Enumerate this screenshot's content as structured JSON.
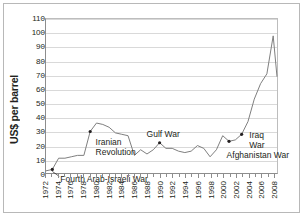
{
  "chart_data": {
    "type": "line",
    "title": "",
    "xlabel": "",
    "ylabel": "US$ per barrel",
    "ylim": [
      0,
      110
    ],
    "xlim": [
      1972,
      2008.6
    ],
    "ytick_labels": [
      "0",
      "10",
      "20",
      "30",
      "40",
      "50",
      "60",
      "70",
      "80",
      "90",
      "100",
      "110"
    ],
    "ytick_values": [
      0,
      10,
      20,
      30,
      40,
      50,
      60,
      70,
      80,
      90,
      100,
      110
    ],
    "xtick_labels": [
      "1972",
      "1974",
      "1976",
      "1978",
      "1980",
      "1982",
      "1984",
      "1986",
      "1988",
      "1990",
      "1992",
      "1994",
      "1996",
      "1998",
      "2000",
      "2002",
      "2004",
      "2006",
      "2008"
    ],
    "xtick_values": [
      1972,
      1974,
      1976,
      1978,
      1980,
      1982,
      1984,
      1986,
      1988,
      1990,
      1992,
      1994,
      1996,
      1998,
      2000,
      2002,
      2004,
      2006,
      2008
    ],
    "grid": true,
    "legend": "none",
    "series": [
      {
        "name": "Crude oil price",
        "color": "#7f7f7f",
        "x": [
          1972,
          1973,
          1974,
          1975,
          1976,
          1977,
          1978,
          1979,
          1980,
          1981,
          1982,
          1983,
          1984,
          1985,
          1986,
          1987,
          1988,
          1989,
          1990,
          1991,
          1992,
          1993,
          1994,
          1995,
          1996,
          1997,
          1998,
          1999,
          2000,
          2001,
          2002,
          2003,
          2004,
          2005,
          2006,
          2007,
          2008,
          2008.6
        ],
        "values": [
          2,
          3,
          11,
          11,
          12,
          13,
          13,
          30,
          36,
          35,
          33,
          29,
          28,
          27,
          13,
          17,
          14,
          17,
          22,
          18,
          18,
          16,
          15,
          16,
          20,
          18,
          12,
          17,
          27,
          23,
          24,
          28,
          37,
          53,
          64,
          71,
          98,
          69
        ]
      }
    ],
    "annotations": [
      {
        "label": "Fourth Arab-Israeli War",
        "x": 1973,
        "y": 3,
        "marker": true
      },
      {
        "label": "Iranian Revolution",
        "x": 1979,
        "y": 30,
        "marker": true
      },
      {
        "label": "Gulf War",
        "x": 1990,
        "y": 22,
        "marker": true
      },
      {
        "label": "Afghanistan War",
        "x": 2001,
        "y": 23,
        "marker": true
      },
      {
        "label": "Iraq War",
        "x": 2003,
        "y": 28,
        "marker": true
      }
    ],
    "annotation_lines": {
      "iranian_revolution": [
        "Iranian",
        "Revolution"
      ],
      "iraq_war": [
        "Iraq",
        "War"
      ]
    }
  }
}
